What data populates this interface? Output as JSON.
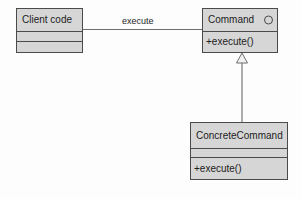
{
  "diagram": {
    "type": "uml-class-diagram",
    "background_color": "#fdfdfd",
    "box_fill_color": "#d6d6d6",
    "line_color": "#4a4a4a",
    "text_color": "#1c1c1c"
  },
  "classes": {
    "client": {
      "name": "Client code",
      "attributes": "",
      "operations": ""
    },
    "command": {
      "name": "Command",
      "stereotype_icon": "interface-circle",
      "operations": "+execute()"
    },
    "concrete_command": {
      "name": "ConcreteCommand",
      "attributes": "",
      "operations": "+execute()"
    }
  },
  "relationships": {
    "association": {
      "label": "execute",
      "from": "Client code",
      "to": "Command",
      "style": "solid-line"
    },
    "generalization": {
      "label": "",
      "from": "ConcreteCommand",
      "to": "Command",
      "style": "solid-line-hollow-triangle"
    }
  }
}
